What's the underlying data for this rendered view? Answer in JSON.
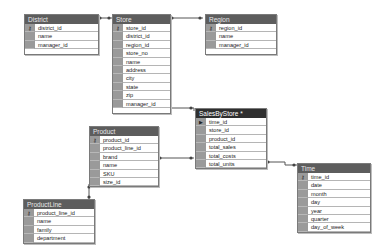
{
  "diagram": {
    "tables": [
      {
        "id": "district",
        "title": "District",
        "columns": [
          {
            "name": "district_id",
            "key": "pk"
          },
          {
            "name": "name"
          },
          {
            "name": "manager_id"
          }
        ]
      },
      {
        "id": "store",
        "title": "Store",
        "columns": [
          {
            "name": "store_id",
            "key": "pk"
          },
          {
            "name": "district_id"
          },
          {
            "name": "region_id"
          },
          {
            "name": "store_no"
          },
          {
            "name": "name"
          },
          {
            "name": "address"
          },
          {
            "name": "city"
          },
          {
            "name": "state"
          },
          {
            "name": "zip"
          },
          {
            "name": "manager_id"
          }
        ]
      },
      {
        "id": "region",
        "title": "Region",
        "columns": [
          {
            "name": "region_id",
            "key": "pk"
          },
          {
            "name": "name"
          },
          {
            "name": "manager_id"
          }
        ]
      },
      {
        "id": "salesbystore",
        "title": "SalesByStore *",
        "columns": [
          {
            "name": "time_id",
            "key": "current"
          },
          {
            "name": "store_id"
          },
          {
            "name": "product_id"
          },
          {
            "name": "total_sales"
          },
          {
            "name": "total_costs"
          },
          {
            "name": "total_units"
          }
        ]
      },
      {
        "id": "product",
        "title": "Product",
        "columns": [
          {
            "name": "product_id",
            "key": "pk"
          },
          {
            "name": "product_line_id"
          },
          {
            "name": "brand"
          },
          {
            "name": "name"
          },
          {
            "name": "SKU"
          },
          {
            "name": "size_id"
          }
        ]
      },
      {
        "id": "time",
        "title": "Time",
        "columns": [
          {
            "name": "time_id",
            "key": "pk"
          },
          {
            "name": "date"
          },
          {
            "name": "month"
          },
          {
            "name": "day"
          },
          {
            "name": "year"
          },
          {
            "name": "quarter"
          },
          {
            "name": "day_of_week"
          }
        ]
      },
      {
        "id": "productline",
        "title": "ProductLine",
        "columns": [
          {
            "name": "product_line_id",
            "key": "pk"
          },
          {
            "name": "name"
          },
          {
            "name": "family"
          },
          {
            "name": "department"
          }
        ]
      }
    ],
    "icons": {
      "pk": "⚷",
      "current": "▶"
    }
  }
}
